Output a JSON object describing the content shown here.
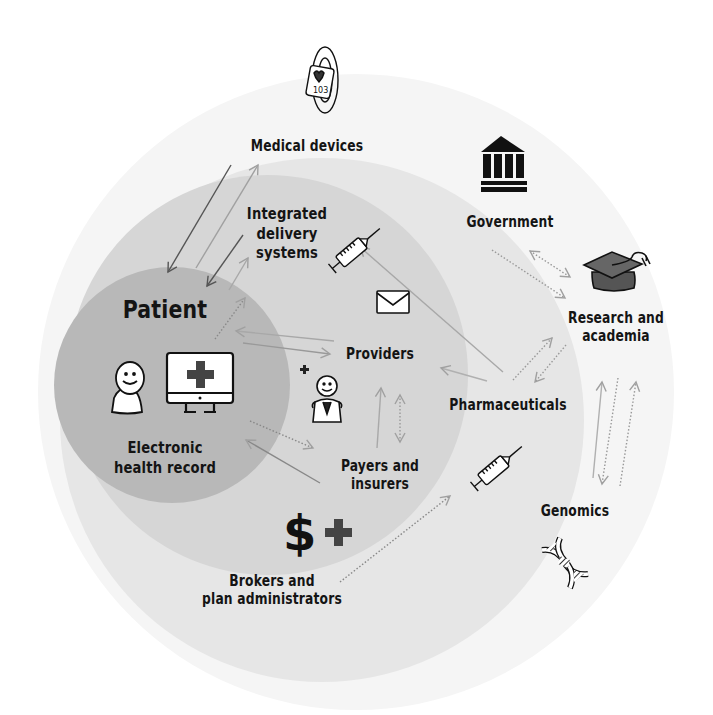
{
  "diagram": {
    "colors": {
      "outer_ring": "#f4f4f4",
      "middle_ring": "#e4e4e4",
      "inner_ring": "#d3d3d3",
      "patient_core": "#b5b5b5",
      "text": "#141414",
      "arrow_dark": "#555555",
      "arrow_light": "#a8a8a8",
      "icon_fill_dark": "#555555"
    },
    "nodes": [
      {
        "id": "medical-devices",
        "label": "Medical devices",
        "icon": "wearable-device-icon",
        "ring": "outer"
      },
      {
        "id": "integrated-delivery",
        "label": "Integrated\ndelivery\nsystems",
        "icon": "syringe-icon",
        "ring": "inner"
      },
      {
        "id": "patient",
        "label": "Patient",
        "icon": "person-icon",
        "ring": "core"
      },
      {
        "id": "ehr",
        "label": "Electronic\nhealth record",
        "icon": "monitor-medical-icon",
        "ring": "core"
      },
      {
        "id": "providers",
        "label": "Providers",
        "icon": "doctor-icon",
        "ring": "inner"
      },
      {
        "id": "payers",
        "label": "Payers and\ninsurers",
        "icon": "dollar-plus-icon",
        "ring": "inner"
      },
      {
        "id": "brokers",
        "label": "Brokers and\nplan administrators",
        "icon": "",
        "ring": "middle"
      },
      {
        "id": "pharma",
        "label": "Pharmaceuticals",
        "icon": "syringe-icon",
        "ring": "middle"
      },
      {
        "id": "government",
        "label": "Government",
        "icon": "government-building-icon",
        "ring": "outer"
      },
      {
        "id": "research",
        "label": "Research and\nacademia",
        "icon": "graduation-cap-icon",
        "ring": "outer"
      },
      {
        "id": "genomics",
        "label": "Genomics",
        "icon": "dna-icon",
        "ring": "outer"
      }
    ],
    "labels": {
      "medical_devices": "Medical devices",
      "integrated_1": "Integrated",
      "integrated_2": "delivery",
      "integrated_3": "systems",
      "patient": "Patient",
      "ehr_1": "Electronic",
      "ehr_2": "health record",
      "providers": "Providers",
      "payers_1": "Payers and",
      "payers_2": "insurers",
      "brokers_1": "Brokers and",
      "brokers_2": "plan administrators",
      "pharma": "Pharmaceuticals",
      "government": "Government",
      "research_1": "Research and",
      "research_2": "academia",
      "genomics": "Genomics",
      "device_readout": "103"
    },
    "edges": [
      {
        "from": "medical-devices",
        "to": "patient",
        "style": "solid-dark"
      },
      {
        "from": "patient",
        "to": "medical-devices",
        "style": "solid-light"
      },
      {
        "from": "integrated-delivery",
        "to": "patient",
        "style": "solid-dark"
      },
      {
        "from": "patient",
        "to": "integrated-delivery",
        "style": "solid-light"
      },
      {
        "from": "patient",
        "to": "integrated-delivery",
        "style": "dotted"
      },
      {
        "from": "providers",
        "to": "patient",
        "style": "solid-light"
      },
      {
        "from": "patient",
        "to": "providers",
        "style": "solid-light"
      },
      {
        "from": "patient",
        "to": "payers",
        "style": "dotted"
      },
      {
        "from": "payers",
        "to": "patient",
        "style": "solid-light"
      },
      {
        "from": "payers",
        "to": "providers",
        "style": "solid-light"
      },
      {
        "from": "providers",
        "to": "payers",
        "style": "dotted-double"
      },
      {
        "from": "pharma",
        "to": "integrated-delivery",
        "style": "solid-light"
      },
      {
        "from": "pharma",
        "to": "providers",
        "style": "solid-light"
      },
      {
        "from": "pharma",
        "to": "research",
        "style": "dotted"
      },
      {
        "from": "research",
        "to": "pharma",
        "style": "dotted"
      },
      {
        "from": "government",
        "to": "research",
        "style": "dotted"
      },
      {
        "from": "research",
        "to": "government",
        "style": "dotted-double"
      },
      {
        "from": "genomics",
        "to": "research",
        "style": "solid-light"
      },
      {
        "from": "research",
        "to": "genomics",
        "style": "dotted"
      },
      {
        "from": "genomics",
        "to": "research",
        "style": "dotted"
      },
      {
        "from": "brokers",
        "to": "pharma",
        "style": "dotted"
      }
    ]
  }
}
